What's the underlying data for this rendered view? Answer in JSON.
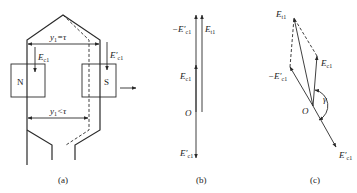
{
  "figure": {
    "panels": [
      {
        "id": "a",
        "caption": "(a)",
        "pole_left": "N",
        "pole_right": "S",
        "pitch_full_label": "y",
        "pitch_full_sub": "1",
        "pitch_full_rel": "=τ",
        "pitch_short_label": "y",
        "pitch_short_sub": "1",
        "pitch_short_rel": "<τ",
        "emf_left": {
          "sym": "E",
          "sub": "c1",
          "prime": ""
        },
        "emf_right": {
          "sym": "E",
          "sub": "c1",
          "prime": "′"
        }
      },
      {
        "id": "b",
        "caption": "(b)",
        "origin": "O",
        "phasors": [
          {
            "name": "-E'c1",
            "sign": "−",
            "sym": "E",
            "sub": "c1",
            "prime": "′"
          },
          {
            "name": "Et1",
            "sign": "",
            "sym": "E",
            "sub": "t1",
            "prime": ""
          },
          {
            "name": "Ec1",
            "sign": "",
            "sym": "E",
            "sub": "c1",
            "prime": ""
          },
          {
            "name": "E'c1",
            "sign": "",
            "sym": "E",
            "sub": "c1",
            "prime": "′"
          }
        ]
      },
      {
        "id": "c",
        "caption": "(c)",
        "origin": "O",
        "angle": "γ",
        "phasors": [
          {
            "name": "Et1",
            "sign": "",
            "sym": "E",
            "sub": "t1",
            "prime": ""
          },
          {
            "name": "Ec1",
            "sign": "",
            "sym": "E",
            "sub": "c1",
            "prime": ""
          },
          {
            "name": "-E'c1",
            "sign": "−",
            "sym": "E",
            "sub": "c1",
            "prime": "′"
          },
          {
            "name": "E'c1",
            "sign": "",
            "sym": "E",
            "sub": "c1",
            "prime": "′"
          }
        ]
      }
    ]
  }
}
